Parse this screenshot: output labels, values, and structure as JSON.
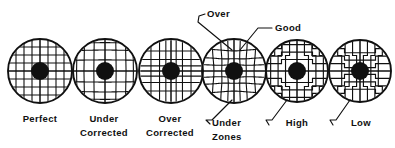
{
  "figure": {
    "background_color": "#ffffff",
    "ink_color": "#101010",
    "width": 395,
    "height": 148
  },
  "patterns": [
    {
      "id": "perfect",
      "label": "Perfect",
      "label_line2": "",
      "cx": 40,
      "cy": 71,
      "r": 32,
      "pupil_r": 9,
      "distortion": "none",
      "amount": 0
    },
    {
      "id": "under-corrected",
      "label": "Under",
      "label_line2": "Corrected",
      "cx": 105,
      "cy": 71,
      "r": 32,
      "pupil_r": 9,
      "distortion": "barrel",
      "amount": 0.42
    },
    {
      "id": "over-corrected",
      "label": "Over",
      "label_line2": "Corrected",
      "cx": 171,
      "cy": 71,
      "r": 32,
      "pupil_r": 9,
      "distortion": "pincushion",
      "amount": 0.42
    },
    {
      "id": "zones",
      "label": "",
      "label_line2": "",
      "cx": 234,
      "cy": 71,
      "r": 32,
      "pupil_r": 9,
      "distortion": "zonal",
      "amount": 0.4
    },
    {
      "id": "high",
      "label": "High",
      "label_line2": "",
      "cx": 297,
      "cy": 71,
      "r": 31,
      "pupil_r": 9,
      "distortion": "step-high",
      "amount": 0.35
    },
    {
      "id": "low",
      "label": "Low",
      "label_line2": "",
      "cx": 360,
      "cy": 71,
      "r": 31,
      "pupil_r": 9,
      "distortion": "step-low",
      "amount": 0.3
    }
  ],
  "captions": [
    {
      "id": "caption-perfect",
      "text": "Perfect",
      "x": 40,
      "y": 122
    },
    {
      "id": "caption-under-1",
      "text": "Under",
      "x": 104,
      "y": 122
    },
    {
      "id": "caption-under-2",
      "text": "Corrected",
      "x": 104,
      "y": 136
    },
    {
      "id": "caption-over-1",
      "text": "Over",
      "x": 170,
      "y": 122
    },
    {
      "id": "caption-over-2",
      "text": "Corrected",
      "x": 170,
      "y": 136
    },
    {
      "id": "caption-high",
      "text": "High",
      "x": 297,
      "y": 126
    },
    {
      "id": "caption-low",
      "text": "Low",
      "x": 361,
      "y": 126
    }
  ],
  "callouts": [
    {
      "id": "callout-over",
      "text": "Over",
      "text_x": 207,
      "text_y": 17,
      "anchor": "start",
      "leader": "M 205 14 L 199 16 L 198 22 L 232 50"
    },
    {
      "id": "callout-good",
      "text": "Good",
      "text_x": 275,
      "text_y": 31,
      "anchor": "start",
      "leader": "M 272 28 L 258 28 L 240 50"
    },
    {
      "id": "callout-under-zones",
      "text": "Under",
      "text_line2": "Zones",
      "text_x": 212,
      "text_y": 126,
      "anchor": "start",
      "leader": "M 232 100 L 212 120 L 206 120 L 210 124"
    },
    {
      "id": "callout-high-leader",
      "text": "",
      "leader": "M 287 100 L 272 120 L 266 120 L 269 125"
    },
    {
      "id": "callout-low-leader",
      "text": "",
      "leader": "M 350 100 L 336 120 L 330 120 L 333 125"
    }
  ],
  "callout_lines": {
    "under_zones_line1": "Under",
    "under_zones_line2": "Zones"
  }
}
